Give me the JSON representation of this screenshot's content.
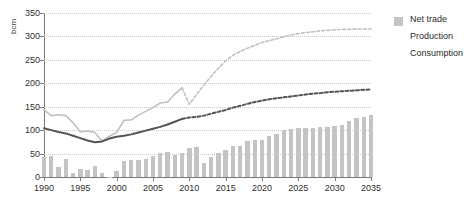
{
  "title_fragment": "",
  "axes": {
    "y_unit_label": "bcm",
    "y_ticks": [
      "0",
      "50",
      "100",
      "150",
      "200",
      "250",
      "300",
      "350"
    ],
    "x_ticks": [
      "1990",
      "1995",
      "2000",
      "2005",
      "2010",
      "2015",
      "2020",
      "2025",
      "2030",
      "2035"
    ]
  },
  "legend": {
    "items": [
      {
        "label": "Net trade",
        "marker": "square",
        "color": "#c4c4c4"
      },
      {
        "label": "Production",
        "marker": "line",
        "color": "#c0c0c0"
      },
      {
        "label": "Consumption",
        "marker": "line",
        "color": "#545454"
      }
    ]
  },
  "colors": {
    "bar": "#c4c4c4",
    "production": "#c0c0c0",
    "consumption": "#545454",
    "grid": "#c9c9c9",
    "axis": "#7a7a7a",
    "text": "#2f2f2f"
  },
  "chart_data": {
    "type": "bar",
    "title": "",
    "xlabel": "",
    "ylabel": "bcm",
    "ylim": [
      0,
      350
    ],
    "xlim": [
      1990,
      2035
    ],
    "grid": true,
    "legend_position": "right",
    "forecast_start_year": 2009,
    "x": [
      1990,
      1991,
      1992,
      1993,
      1994,
      1995,
      1996,
      1997,
      1998,
      1999,
      2000,
      2001,
      2002,
      2003,
      2004,
      2005,
      2006,
      2007,
      2008,
      2009,
      2010,
      2011,
      2012,
      2013,
      2014,
      2015,
      2016,
      2017,
      2018,
      2019,
      2020,
      2021,
      2022,
      2023,
      2024,
      2025,
      2026,
      2027,
      2028,
      2029,
      2030,
      2031,
      2032,
      2033,
      2034,
      2035
    ],
    "series": [
      {
        "name": "Net trade",
        "type": "bar",
        "values": [
          42,
          45,
          21,
          39,
          8,
          17,
          16,
          23,
          9,
          1,
          13,
          35,
          37,
          37,
          39,
          45,
          52,
          53,
          48,
          51,
          61,
          65,
          30,
          42,
          52,
          58,
          66,
          67,
          76,
          79,
          78,
          88,
          92,
          101,
          103,
          104,
          104,
          105,
          106,
          107,
          108,
          112,
          119,
          126,
          128,
          132
        ]
      },
      {
        "name": "Production",
        "type": "line",
        "values": [
          143,
          131,
          133,
          131,
          116,
          96,
          98,
          95,
          77,
          87,
          95,
          121,
          122,
          132,
          140,
          148,
          158,
          160,
          177,
          190,
          155,
          176,
          196,
          215,
          232,
          248,
          260,
          268,
          275,
          281,
          287,
          291,
          295,
          299,
          303,
          306,
          308,
          310,
          312,
          313,
          314,
          315,
          315,
          316,
          316,
          316
        ]
      },
      {
        "name": "Consumption",
        "type": "line",
        "values": [
          104,
          100,
          96,
          93,
          88,
          83,
          78,
          74,
          76,
          82,
          86,
          88,
          91,
          95,
          99,
          103,
          107,
          112,
          118,
          124,
          127,
          128,
          131,
          135,
          139,
          143,
          148,
          152,
          156,
          160,
          163,
          166,
          168,
          170,
          172,
          174,
          176,
          178,
          179,
          181,
          182,
          183,
          184,
          185,
          186,
          187
        ]
      }
    ]
  }
}
